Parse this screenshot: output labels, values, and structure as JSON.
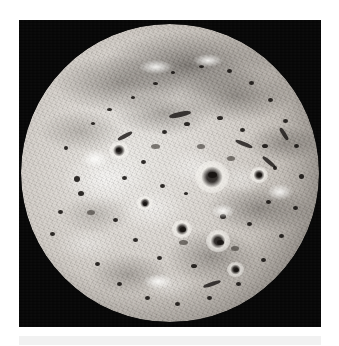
{
  "page": {
    "background_color": "#ffffff",
    "width": 339,
    "height": 346
  },
  "photo": {
    "subject": "Io",
    "description": "Full-disc grayscale image of Jupiter's volcanic moon Io against black space",
    "frame": {
      "x": 19,
      "y": 20,
      "width": 302,
      "height": 307,
      "background_color": "#060606"
    },
    "disc": {
      "center_x": 151,
      "center_y": 153,
      "radius": 149,
      "highlight_color": "#e9e7e3",
      "midtone_color": "#b9b3ac",
      "shadow_color": "#585149"
    },
    "features": {
      "dark_spots_label": "volcanic paterae",
      "bright_ring_label": "ringed volcanic plume deposit",
      "ring_center_x": 205,
      "ring_center_y": 168
    }
  },
  "caption": {
    "strip_color": "#f1f1f1",
    "text": ""
  }
}
